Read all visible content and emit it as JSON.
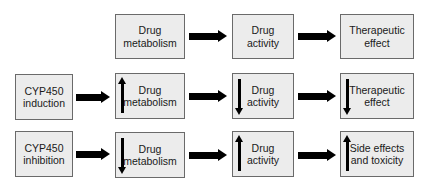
{
  "diagram": {
    "title": "",
    "colors": {
      "box_fill": "#ececec",
      "box_border": "#6a6a6a",
      "arrow": "#000000",
      "text": "#1a1a1a"
    },
    "rows": [
      {
        "id": "baseline",
        "cause": null,
        "steps": [
          {
            "label": "Drug\nmetabolism",
            "indicator": null
          },
          {
            "label": "Drug\nactivity",
            "indicator": null
          },
          {
            "label": "Therapeutic\neffect",
            "indicator": null
          }
        ]
      },
      {
        "id": "induction",
        "cause": {
          "label": "CYP450\ninduction"
        },
        "steps": [
          {
            "label": "Drug\nmetabolism",
            "indicator": "up"
          },
          {
            "label": "Drug\nactivity",
            "indicator": "down"
          },
          {
            "label": "Therapeutic\neffect",
            "indicator": "down"
          }
        ]
      },
      {
        "id": "inhibition",
        "cause": {
          "label": "CYP450\ninhibition"
        },
        "steps": [
          {
            "label": "Drug\nmetabolism",
            "indicator": "down"
          },
          {
            "label": "Drug\nactivity",
            "indicator": "up"
          },
          {
            "label": "Side effects\nand toxicity",
            "indicator": "up"
          }
        ]
      }
    ],
    "edges": [
      {
        "from": "baseline.metabolism",
        "to": "baseline.activity",
        "type": "arrow-right"
      },
      {
        "from": "baseline.activity",
        "to": "baseline.effect",
        "type": "arrow-right"
      },
      {
        "from": "induction.cause",
        "to": "induction.metabolism",
        "type": "arrow-right"
      },
      {
        "from": "induction.metabolism",
        "to": "induction.activity",
        "type": "arrow-right"
      },
      {
        "from": "induction.activity",
        "to": "induction.effect",
        "type": "arrow-right"
      },
      {
        "from": "inhibition.cause",
        "to": "inhibition.metabolism",
        "type": "arrow-right"
      },
      {
        "from": "inhibition.metabolism",
        "to": "inhibition.activity",
        "type": "arrow-right"
      },
      {
        "from": "inhibition.activity",
        "to": "inhibition.effect",
        "type": "arrow-right"
      }
    ],
    "indicator_legend": {
      "up": "increase",
      "down": "decrease"
    }
  }
}
